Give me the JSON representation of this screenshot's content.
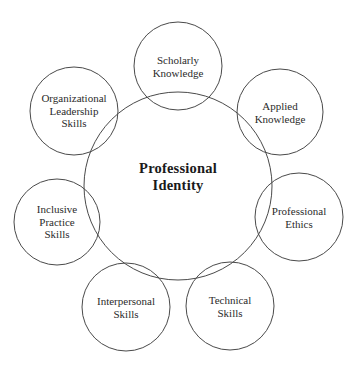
{
  "diagram": {
    "type": "concept-map",
    "stroke_color": "#4a4a4a",
    "text_color": "#2b2b2b",
    "center": {
      "label": "Professional\nIdentity",
      "cx": 178,
      "cy": 186,
      "r": 94
    },
    "satellites": [
      {
        "id": "scholarly-knowledge",
        "label": "Scholarly\nKnowledge",
        "cx": 178,
        "cy": 66,
        "r": 44
      },
      {
        "id": "applied-knowledge",
        "label": "Applied\nKnowledge",
        "cx": 280,
        "cy": 112,
        "r": 43
      },
      {
        "id": "professional-ethics",
        "label": "Professional\nEthics",
        "cx": 299,
        "cy": 217,
        "r": 44
      },
      {
        "id": "technical-skills",
        "label": "Technical\nSkills",
        "cx": 230,
        "cy": 306,
        "r": 44
      },
      {
        "id": "interpersonal-skills",
        "label": "Interpersonal\nSkills",
        "cx": 126,
        "cy": 307,
        "r": 44
      },
      {
        "id": "inclusive-practice-skills",
        "label": "Inclusive\nPractice\nSkills",
        "cx": 57,
        "cy": 222,
        "r": 43
      },
      {
        "id": "organizational-leadership-skills",
        "label": "Organizational\nLeadership\nSkills",
        "cx": 74,
        "cy": 111,
        "r": 44
      }
    ]
  }
}
